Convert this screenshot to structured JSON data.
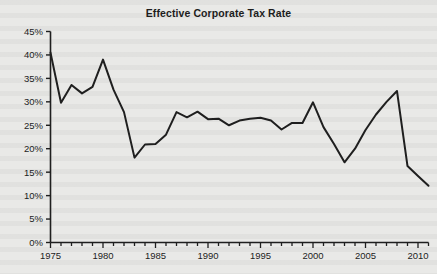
{
  "chart_data": {
    "type": "line",
    "title": "Effective Corporate Tax Rate",
    "xlabel": "",
    "ylabel": "",
    "xlim": [
      1975,
      2011
    ],
    "ylim": [
      0,
      45
    ],
    "grid": false,
    "legend": false,
    "y_tick_labels": [
      "0%",
      "5%",
      "10%",
      "15%",
      "20%",
      "25%",
      "30%",
      "35%",
      "40%",
      "45%"
    ],
    "y_ticks": [
      0,
      5,
      10,
      15,
      20,
      25,
      30,
      35,
      40,
      45
    ],
    "x_tick_labels": [
      "1975",
      "1980",
      "1985",
      "1990",
      "1995",
      "2000",
      "2005",
      "2010"
    ],
    "x_major_ticks": [
      1975,
      1980,
      1985,
      1990,
      1995,
      2000,
      2005,
      2010
    ],
    "x_minor_tick_interval": 1,
    "line_color": "#1f1f1f",
    "line_width": 2,
    "x": [
      1975,
      1976,
      1977,
      1978,
      1979,
      1980,
      1981,
      1982,
      1983,
      1984,
      1985,
      1986,
      1987,
      1988,
      1989,
      1990,
      1991,
      1992,
      1993,
      1994,
      1995,
      1996,
      1997,
      1998,
      1999,
      2000,
      2001,
      2002,
      2003,
      2004,
      2005,
      2006,
      2007,
      2008,
      2009,
      2010,
      2011
    ],
    "values": [
      40.5,
      29.8,
      33.6,
      31.8,
      33.2,
      39.0,
      32.6,
      27.8,
      18.1,
      20.9,
      21.0,
      23.0,
      27.8,
      26.7,
      27.9,
      26.3,
      26.4,
      25.0,
      26.0,
      26.4,
      26.6,
      26.0,
      24.1,
      25.5,
      25.5,
      29.9,
      24.6,
      21.0,
      17.1,
      20.0,
      24.0,
      27.3,
      30.0,
      32.3,
      16.3,
      14.2,
      12.1
    ],
    "series_name": "Effective Corporate Tax Rate"
  },
  "figure": {
    "background_color": "#e9e9e7",
    "axis_color": "#1f1f1f"
  }
}
